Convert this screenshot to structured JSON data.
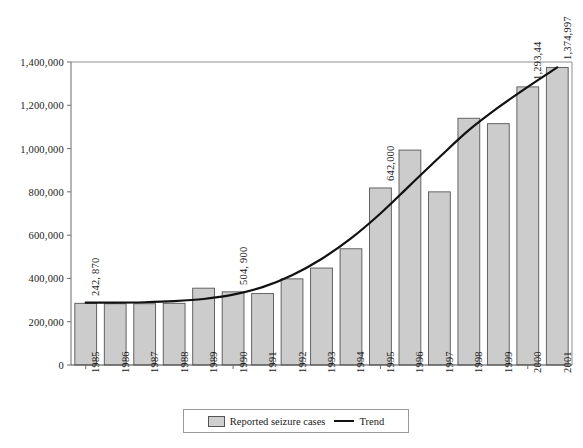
{
  "chart_data": {
    "type": "bar",
    "title": "",
    "xlabel": "",
    "ylabel": "",
    "grid": false,
    "legend_position": "bottom",
    "ylim": [
      0,
      1400000
    ],
    "ytick_values": [
      0,
      200000,
      400000,
      600000,
      800000,
      1000000,
      1200000,
      1400000
    ],
    "ytick_labels": [
      "0",
      "200,000",
      "400,000",
      "600,000",
      "800,000",
      "1,000,000",
      "1,200,000",
      "1,400,000"
    ],
    "categories": [
      "1985",
      "1986",
      "1987",
      "1988",
      "1989",
      "1990",
      "1991",
      "1992",
      "1993",
      "1994",
      "1995",
      "1996",
      "1997",
      "1998",
      "1999",
      "2000",
      "2001"
    ],
    "series": [
      {
        "name": "Reported seizure cases",
        "type": "bar",
        "color": "#cccccc",
        "edge_color": "#555555",
        "values": [
          285000,
          283000,
          283000,
          285000,
          355000,
          338000,
          330000,
          398000,
          448000,
          537000,
          818000,
          993000,
          800000,
          1140000,
          1115000,
          1285000,
          1375000
        ]
      },
      {
        "name": "Trend",
        "type": "line",
        "color": "#111111",
        "values": [
          288000,
          288000,
          290000,
          295000,
          305000,
          325000,
          360000,
          415000,
          490000,
          585000,
          700000,
          830000,
          960000,
          1085000,
          1190000,
          1285000,
          1375000
        ]
      }
    ],
    "data_labels": [
      {
        "category": "1985",
        "text": "242, 870"
      },
      {
        "category": "1990",
        "text": "504, 900"
      },
      {
        "category": "1995",
        "text": "642,000"
      },
      {
        "category": "2000",
        "text": "1,293,44"
      },
      {
        "category": "2001",
        "text": "1,374,997"
      }
    ]
  },
  "legend": {
    "bar_label": "Reported seizure cases",
    "line_label": "Trend"
  },
  "caption": ""
}
